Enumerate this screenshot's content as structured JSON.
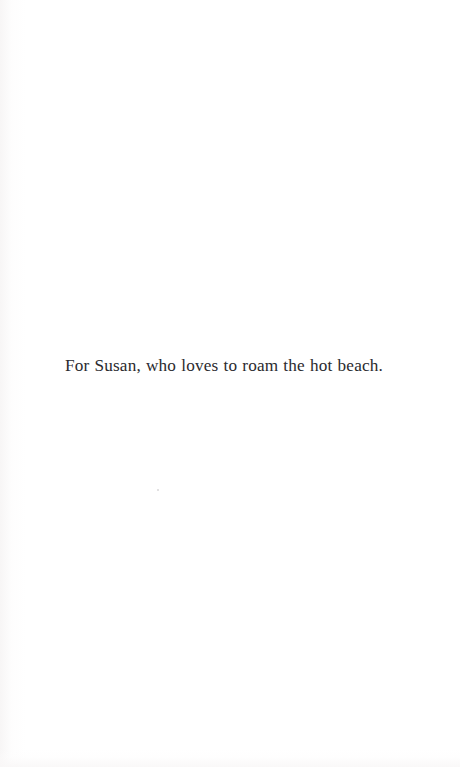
{
  "page": {
    "kind": "book-dedication-page",
    "background_color": "#ffffff",
    "ink_color": "#2a2a2e"
  },
  "dedication": {
    "text": "For Susan, who loves to roam the hot beach."
  },
  "artifacts": {
    "dust_speck_label": "",
    "gutter_shade_label": "",
    "bottom_edge_label": ""
  }
}
